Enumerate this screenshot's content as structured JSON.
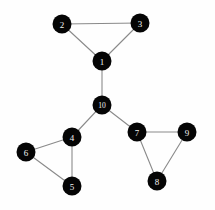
{
  "figure": {
    "background_color": "#fefefe",
    "node_fill_color": "#050505",
    "node_label_color": "#f2f2f2",
    "edge_color": "#8a8a8a",
    "width": 215,
    "height": 210
  },
  "chart_data": {
    "type": "diagram",
    "subtype": "node-link-graph",
    "title": "",
    "directed": false,
    "weighted": false,
    "node_count": 10,
    "edge_count": 12,
    "node_radius": 9.5,
    "nodes": [
      {
        "id": "1",
        "label": "1",
        "x": 102,
        "y": 61,
        "degree": 3
      },
      {
        "id": "2",
        "label": "2",
        "x": 62,
        "y": 24,
        "degree": 2
      },
      {
        "id": "3",
        "label": "3",
        "x": 140,
        "y": 23,
        "degree": 2
      },
      {
        "id": "4",
        "label": "4",
        "x": 72,
        "y": 137,
        "degree": 3
      },
      {
        "id": "5",
        "label": "5",
        "x": 72,
        "y": 186,
        "degree": 2
      },
      {
        "id": "6",
        "label": "6",
        "x": 26,
        "y": 152,
        "degree": 2
      },
      {
        "id": "7",
        "label": "7",
        "x": 137,
        "y": 132,
        "degree": 3
      },
      {
        "id": "8",
        "label": "8",
        "x": 157,
        "y": 181,
        "degree": 2
      },
      {
        "id": "9",
        "label": "9",
        "x": 187,
        "y": 132,
        "degree": 2
      },
      {
        "id": "10",
        "label": "10",
        "x": 102,
        "y": 105,
        "degree": 3
      }
    ],
    "edges": [
      {
        "source": "2",
        "target": "3"
      },
      {
        "source": "2",
        "target": "1"
      },
      {
        "source": "3",
        "target": "1"
      },
      {
        "source": "1",
        "target": "10"
      },
      {
        "source": "10",
        "target": "4"
      },
      {
        "source": "10",
        "target": "7"
      },
      {
        "source": "4",
        "target": "6"
      },
      {
        "source": "4",
        "target": "5"
      },
      {
        "source": "6",
        "target": "5"
      },
      {
        "source": "7",
        "target": "9"
      },
      {
        "source": "7",
        "target": "8"
      },
      {
        "source": "9",
        "target": "8"
      }
    ],
    "components": [
      {
        "name": "top-triangle",
        "members": [
          "1",
          "2",
          "3"
        ]
      },
      {
        "name": "left-triangle",
        "members": [
          "4",
          "5",
          "6"
        ]
      },
      {
        "name": "right-triangle",
        "members": [
          "7",
          "8",
          "9"
        ]
      },
      {
        "name": "hub",
        "members": [
          "10"
        ]
      }
    ]
  }
}
